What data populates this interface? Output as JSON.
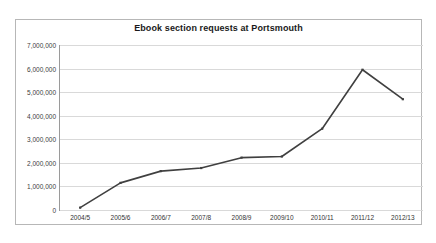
{
  "chart_data": {
    "type": "line",
    "title": "Ebook section requests at Portsmouth",
    "xlabel": "",
    "ylabel": "",
    "grid": true,
    "legend": "none",
    "line_color": "#404040",
    "background_color": "#ffffff",
    "border_color": "#b7b7b7",
    "gridline_color": "#d9d9d9",
    "categories": [
      "2004/5",
      "2005/6",
      "2006/7",
      "2007/8",
      "2008/9",
      "2009/10",
      "2010/11",
      "2011/12",
      "2012/13"
    ],
    "values": [
      100000,
      1150000,
      1650000,
      1780000,
      2220000,
      2270000,
      3450000,
      5950000,
      4700000
    ],
    "series": [
      {
        "name": "Ebook section requests",
        "values": [
          100000,
          1150000,
          1650000,
          1780000,
          2220000,
          2270000,
          3450000,
          5950000,
          4700000
        ]
      }
    ],
    "ylim": [
      0,
      7000000
    ],
    "ytick_values": [
      0,
      1000000,
      2000000,
      3000000,
      4000000,
      5000000,
      6000000,
      7000000
    ],
    "ytick_labels": [
      "0",
      "1,000,000",
      "2,000,000",
      "3,000,000",
      "4,000,000",
      "5,000,000",
      "6,000,000",
      "7,000,000"
    ]
  }
}
